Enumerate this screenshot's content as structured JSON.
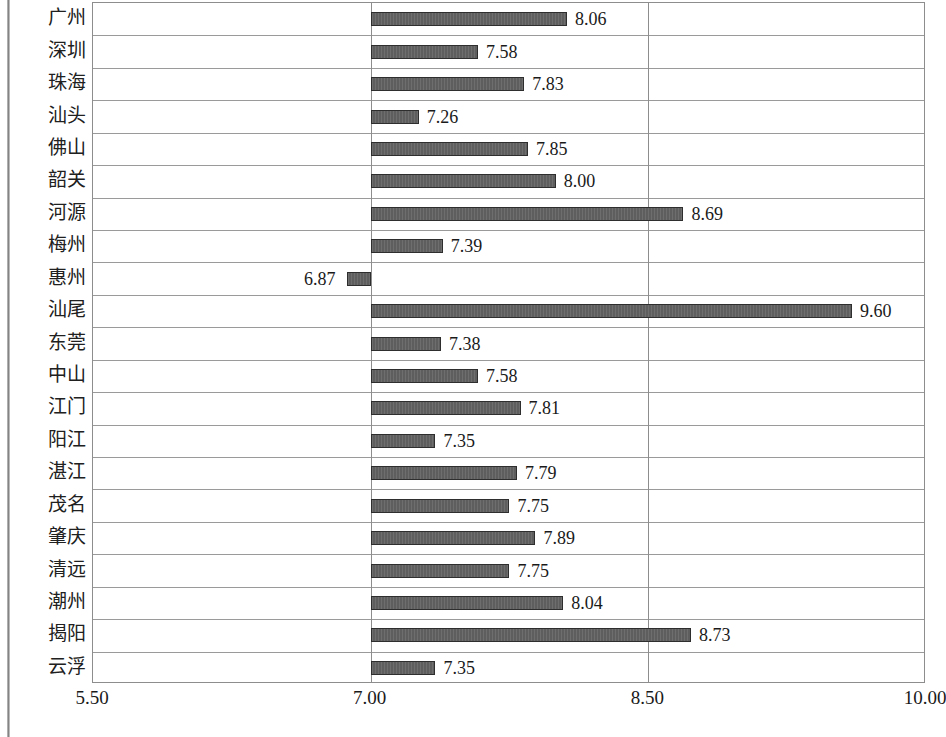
{
  "chart_data": {
    "type": "bar",
    "orientation": "horizontal",
    "title": "",
    "subtitle": "",
    "xlabel": "",
    "ylabel": "",
    "xlim": [
      5.5,
      10.0
    ],
    "xticks": [
      "5.50",
      "7.00",
      "8.50",
      "10.00"
    ],
    "xtick_values": [
      5.5,
      7.0,
      8.5,
      10.0
    ],
    "baseline": 7.0,
    "grid": "vertical-at-ticks-plus-row-separators",
    "legend": null,
    "bar_color": "#5e5e5e",
    "bar_border_color": "#2e2e2e",
    "categories": [
      "广州",
      "深圳",
      "珠海",
      "汕头",
      "佛山",
      "韶关",
      "河源",
      "梅州",
      "惠州",
      "汕尾",
      "东莞",
      "中山",
      "江门",
      "阳江",
      "湛江",
      "茂名",
      "肇庆",
      "清远",
      "潮州",
      "揭阳",
      "云浮"
    ],
    "values": [
      8.06,
      7.58,
      7.83,
      7.26,
      7.85,
      8.0,
      8.69,
      7.39,
      6.87,
      9.6,
      7.38,
      7.58,
      7.81,
      7.35,
      7.79,
      7.75,
      7.89,
      7.75,
      8.04,
      8.73,
      7.35
    ],
    "value_labels": [
      "8.06",
      "7.58",
      "7.83",
      "7.26",
      "7.85",
      "8.00",
      "8.69",
      "7.39",
      "6.87",
      "9.60",
      "7.38",
      "7.58",
      "7.81",
      "7.35",
      "7.79",
      "7.75",
      "7.89",
      "7.75",
      "8.04",
      "8.73",
      "7.35"
    ]
  }
}
